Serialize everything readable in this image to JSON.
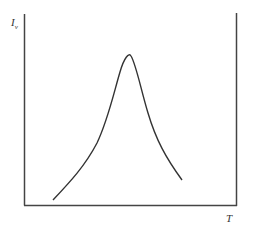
{
  "diagram": {
    "y_axis_label": "I",
    "y_axis_subscript": "v",
    "x_axis_label": "T",
    "curve": {
      "shape": "bell-shaped peak",
      "points": [
        [
          53,
          200
        ],
        [
          75,
          177
        ],
        [
          95,
          148
        ],
        [
          110,
          115
        ],
        [
          118,
          85
        ],
        [
          124,
          66
        ],
        [
          127,
          60
        ],
        [
          131,
          64
        ],
        [
          138,
          82
        ],
        [
          148,
          113
        ],
        [
          160,
          145
        ],
        [
          172,
          168
        ],
        [
          182,
          180
        ]
      ]
    },
    "colors": {
      "line": "#333333",
      "axis": "#444444"
    }
  }
}
